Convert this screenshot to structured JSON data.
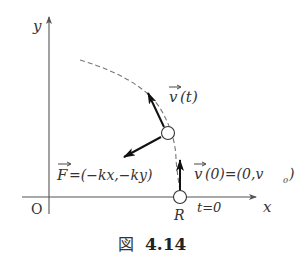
{
  "figure": {
    "caption_prefix": "図",
    "caption_number": "4.14"
  },
  "axes": {
    "x_label": "x",
    "y_label": "y",
    "origin_label": "O"
  },
  "particle_start": {
    "label": "R",
    "time_label": "t=0"
  },
  "vectors": {
    "velocity_t": {
      "symbol": "v",
      "argument": "(t)"
    },
    "velocity_0": {
      "symbol": "v",
      "argument": "(0)=(0,v",
      "subscript": "0",
      "close": ")"
    },
    "force": {
      "symbol": "F",
      "expression": "=(−kx,−ky)"
    }
  },
  "colors": {
    "axis": "#555555",
    "arrow": "#111111",
    "dashed_path": "#777777",
    "text": "#333333"
  }
}
